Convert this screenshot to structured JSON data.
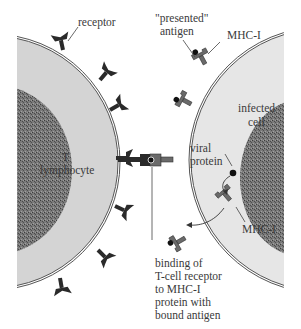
{
  "figure": {
    "colors": {
      "cytoplasm": "#d4d4d4",
      "infected_cytoplasm": "#e4e4e4",
      "nucleus": "#6f6f6f",
      "receptor": "#2a2a2a",
      "mhc": "#6a6a6a",
      "antigen": "#111111",
      "membrane": "#555555",
      "text": "#3a3a3a"
    },
    "labels": {
      "receptor": "receptor",
      "presented_antigen_line1": "\"presented\"",
      "presented_antigen_line2": "antigen",
      "mhc_top": "MHC-I",
      "infected_cell_line1": "infected",
      "infected_cell_line2": "cell",
      "t_lymphocyte_line1": "T",
      "t_lymphocyte_line2": "lymphocyte",
      "viral_protein_line1": "viral",
      "viral_protein_line2": "protein",
      "mhc_bottom": "MHC-I",
      "binding_line1": "binding of",
      "binding_line2": "T-cell receptor",
      "binding_line3": "to MHC-I",
      "binding_line4": "protein with",
      "binding_line5": "bound antigen"
    }
  }
}
